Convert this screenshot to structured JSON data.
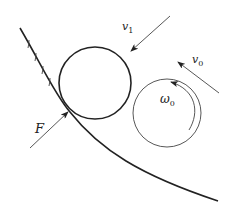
{
  "diagram": {
    "labels": {
      "v1": {
        "main": "v",
        "sub": "1"
      },
      "v0": {
        "main": "v",
        "sub": "0"
      },
      "omega0": {
        "main": "ω",
        "sub": "0"
      },
      "F": {
        "main": "F"
      }
    },
    "colors": {
      "stroke": "#222222",
      "light_stroke": "#555555",
      "background": "#ffffff"
    }
  }
}
